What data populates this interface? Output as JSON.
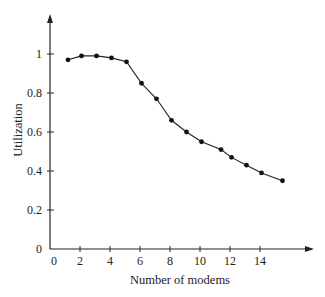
{
  "chart_data": {
    "type": "line",
    "title": "",
    "xlabel": "Number of modems",
    "ylabel": "Utilization",
    "xlim": [
      0,
      17
    ],
    "ylim": [
      0,
      1.15
    ],
    "grid": false,
    "legend": null,
    "x_ticks": [
      0,
      2,
      4,
      6,
      8,
      10,
      12,
      14
    ],
    "x_tick_labels": [
      "0",
      "2",
      "4",
      "6",
      "8",
      "10",
      "12",
      "14"
    ],
    "y_ticks": [
      0,
      0.2,
      0.4,
      0.6,
      0.8,
      1
    ],
    "y_tick_labels": [
      "0",
      "0.2",
      "0.4",
      "0.6",
      "0.8",
      "1"
    ],
    "series": [
      {
        "name": "Utilization",
        "marker": "filled-circle",
        "color": "#111111",
        "x": [
          1.2,
          2.1,
          3.1,
          4.1,
          5.1,
          6.1,
          7.1,
          8.1,
          9.1,
          10.1,
          11.4,
          12.1,
          13.1,
          14.1,
          15.5
        ],
        "y": [
          0.97,
          0.99,
          0.99,
          0.98,
          0.96,
          0.85,
          0.77,
          0.66,
          0.6,
          0.55,
          0.51,
          0.47,
          0.43,
          0.39,
          0.35
        ]
      }
    ]
  },
  "plot": {
    "origin_px": [
      50,
      249
    ],
    "x_px_per_unit": 15,
    "y_px_per_unit": 195,
    "x_axis_end_px": 314,
    "y_axis_top_px": 14,
    "axis_color": "#222222",
    "line_color": "#222222"
  }
}
